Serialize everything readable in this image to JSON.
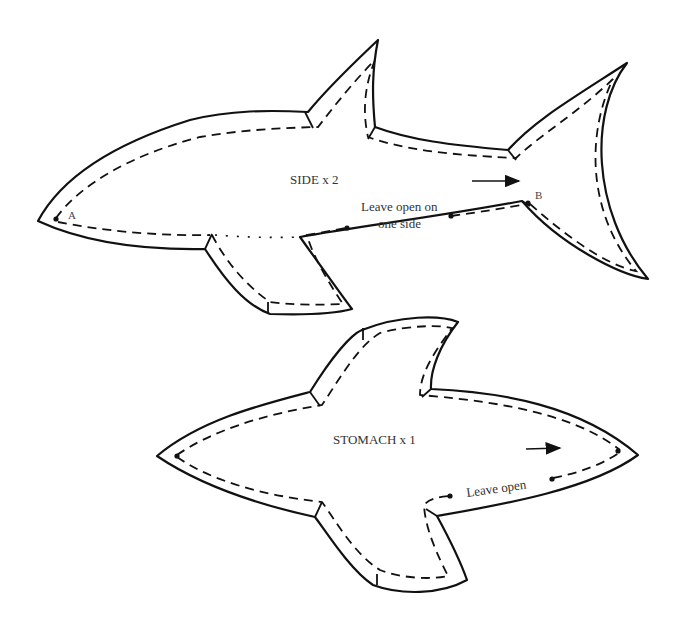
{
  "diagram": {
    "type": "sewing-pattern",
    "pieces": [
      {
        "name": "side",
        "label": "SIDE x 2",
        "points": {
          "a": "A",
          "b": "B"
        },
        "note_line1": "Leave open on",
        "note_line2": "one side",
        "grain_arrow": "right-arrow"
      },
      {
        "name": "stomach",
        "label": "STOMACH x 1",
        "note": "Leave open",
        "grain_arrow": "right-arrow"
      }
    ],
    "colors": {
      "line": "#111111",
      "text": "#333333",
      "background": "#ffffff"
    }
  }
}
